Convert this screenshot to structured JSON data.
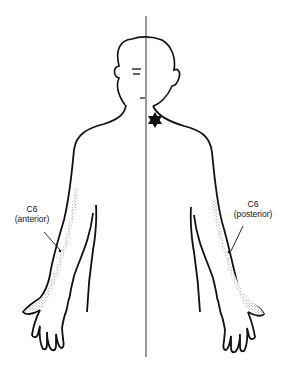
{
  "figure": {
    "labels": {
      "anterior": {
        "line1": "C6",
        "line2": "(anterior)"
      },
      "posterior": {
        "line1": "C6",
        "line2": "(posterior)"
      }
    },
    "markers": {
      "neck_star": "six-pointed-star-icon"
    },
    "colors": {
      "outline": "#111111",
      "stipple": "#8a8a8a",
      "background": "#ffffff"
    }
  }
}
